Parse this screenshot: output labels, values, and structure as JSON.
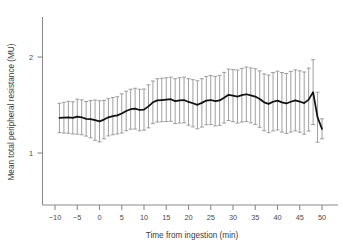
{
  "chart_data": {
    "type": "line",
    "title": "",
    "xlabel": "Time from ingestion (min)",
    "ylabel": "Mean total peripheral resistance (MU)",
    "xlim": [
      -11,
      51
    ],
    "ylim": [
      0.62,
      2.28
    ],
    "xticks": [
      -10,
      -5,
      0,
      5,
      10,
      15,
      20,
      25,
      30,
      35,
      40,
      45,
      50
    ],
    "xticklabels": [
      "−10",
      "−5",
      "0",
      "5",
      "10",
      "15",
      "20",
      "25",
      "30",
      "35",
      "40",
      "45",
      "50"
    ],
    "yticks": [
      1,
      2
    ],
    "yticklabels": [
      "1",
      "2"
    ],
    "grid": false,
    "legend": null,
    "error_bars": {
      "style": "capped-vertical",
      "color": "#8e8e8e",
      "description": "standard error / confidence interval bars at each sample point"
    },
    "line_color": "#101010",
    "x": [
      -9,
      -8,
      -7,
      -6,
      -5,
      -4,
      -3,
      -2,
      -1,
      0,
      1,
      2,
      3,
      4,
      5,
      6,
      7,
      8,
      9,
      10,
      11,
      12,
      13,
      14,
      15,
      16,
      17,
      18,
      19,
      20,
      21,
      22,
      23,
      24,
      25,
      26,
      27,
      28,
      29,
      30,
      31,
      32,
      33,
      34,
      35,
      36,
      37,
      38,
      39,
      40,
      41,
      42,
      43,
      44,
      45,
      46,
      47,
      48,
      49,
      50
    ],
    "y": [
      1.365,
      1.368,
      1.372,
      1.366,
      1.378,
      1.372,
      1.356,
      1.352,
      1.342,
      1.33,
      1.348,
      1.372,
      1.384,
      1.392,
      1.412,
      1.438,
      1.456,
      1.462,
      1.448,
      1.452,
      1.486,
      1.528,
      1.548,
      1.552,
      1.556,
      1.56,
      1.54,
      1.548,
      1.552,
      1.532,
      1.518,
      1.502,
      1.522,
      1.546,
      1.552,
      1.54,
      1.548,
      1.576,
      1.606,
      1.598,
      1.588,
      1.602,
      1.612,
      1.6,
      1.588,
      1.562,
      1.528,
      1.512,
      1.534,
      1.546,
      1.528,
      1.516,
      1.534,
      1.548,
      1.536,
      1.52,
      1.556,
      1.634,
      1.372,
      1.252
    ],
    "y_err_low": [
      1.212,
      1.208,
      1.206,
      1.198,
      1.196,
      1.19,
      1.176,
      1.158,
      1.132,
      1.116,
      1.148,
      1.178,
      1.19,
      1.198,
      1.208,
      1.232,
      1.248,
      1.25,
      1.232,
      1.238,
      1.262,
      1.306,
      1.322,
      1.326,
      1.328,
      1.33,
      1.306,
      1.312,
      1.314,
      1.29,
      1.272,
      1.252,
      1.27,
      1.294,
      1.296,
      1.282,
      1.288,
      1.312,
      1.338,
      1.326,
      1.312,
      1.322,
      1.328,
      1.314,
      1.298,
      1.268,
      1.232,
      1.212,
      1.23,
      1.24,
      1.218,
      1.204,
      1.218,
      1.23,
      1.216,
      1.196,
      1.228,
      1.296,
      1.112,
      1.148
    ],
    "y_err_high": [
      1.518,
      1.528,
      1.538,
      1.534,
      1.56,
      1.554,
      1.536,
      1.546,
      1.552,
      1.544,
      1.548,
      1.566,
      1.578,
      1.586,
      1.616,
      1.644,
      1.664,
      1.674,
      1.664,
      1.666,
      1.71,
      1.75,
      1.774,
      1.778,
      1.784,
      1.79,
      1.774,
      1.784,
      1.79,
      1.774,
      1.764,
      1.752,
      1.774,
      1.798,
      1.808,
      1.798,
      1.808,
      1.84,
      1.874,
      1.87,
      1.864,
      1.882,
      1.896,
      1.886,
      1.878,
      1.856,
      1.824,
      1.812,
      1.838,
      1.852,
      1.838,
      1.828,
      1.85,
      1.866,
      1.856,
      1.844,
      1.884,
      1.972,
      1.632,
      1.356
    ]
  },
  "caption": {
    "text": ""
  }
}
